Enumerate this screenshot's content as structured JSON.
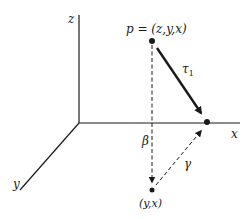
{
  "diagram": {
    "axes": {
      "z_label": "z",
      "x_label": "x",
      "y_label": "y"
    },
    "points": {
      "p_label": "p = (z,y,x)",
      "projection_label": "(y,x)"
    },
    "arrows": {
      "tau_label": "τ",
      "tau_subscript": "1",
      "beta_label": "β",
      "gamma_label": "γ"
    },
    "colors": {
      "ink": "#1a1a1a",
      "background": "#ffffff"
    }
  }
}
